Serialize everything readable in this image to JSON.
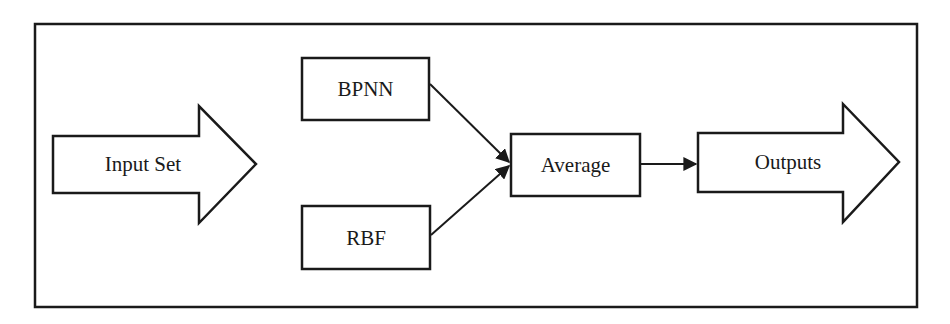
{
  "diagram": {
    "type": "flowchart",
    "colors": {
      "stroke": "#1a1a1a",
      "fill": "#ffffff",
      "text": "#1a1a1a"
    },
    "nodes": {
      "input": {
        "label": "Input Set",
        "shape": "block-arrow-right"
      },
      "bpnn": {
        "label": "BPNN",
        "shape": "rectangle"
      },
      "rbf": {
        "label": "RBF",
        "shape": "rectangle"
      },
      "average": {
        "label": "Average",
        "shape": "rectangle"
      },
      "outputs": {
        "label": "Outputs",
        "shape": "block-arrow-right"
      }
    },
    "edges": [
      {
        "from": "bpnn",
        "to": "average",
        "style": "arrow"
      },
      {
        "from": "rbf",
        "to": "average",
        "style": "arrow"
      },
      {
        "from": "average",
        "to": "outputs",
        "style": "arrow"
      }
    ]
  }
}
